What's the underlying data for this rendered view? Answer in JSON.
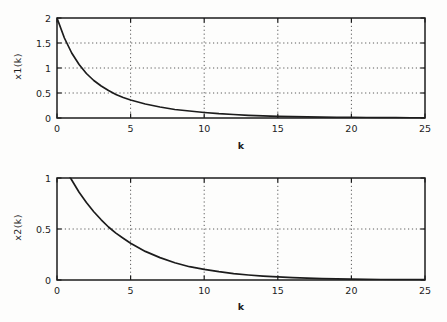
{
  "figure": {
    "background": "#fdfdfc",
    "axis_color": "#1c1c1c",
    "grid_color": "#5a5a5a",
    "line_color": "#1c1c1c"
  },
  "chart_data": [
    {
      "type": "line",
      "title": "",
      "xlabel": "k",
      "ylabel": "x1(k)",
      "xlim": [
        0,
        25
      ],
      "ylim": [
        0,
        2
      ],
      "xticks": [
        0,
        5,
        10,
        15,
        20,
        25
      ],
      "yticks": [
        0,
        0.5,
        1,
        1.5,
        2
      ],
      "grid": true,
      "legend": null,
      "axis_color": "#1c1c1c",
      "grid_color": "#5a5a5a",
      "line_color": "#1c1c1c",
      "points": [
        [
          0,
          2.0
        ],
        [
          0.5,
          1.6
        ],
        [
          1,
          1.3
        ],
        [
          1.5,
          1.07
        ],
        [
          2,
          0.89
        ],
        [
          2.5,
          0.75
        ],
        [
          3,
          0.64
        ],
        [
          3.5,
          0.55
        ],
        [
          4,
          0.47
        ],
        [
          4.5,
          0.41
        ],
        [
          5,
          0.36
        ],
        [
          6,
          0.28
        ],
        [
          7,
          0.22
        ],
        [
          8,
          0.17
        ],
        [
          9,
          0.14
        ],
        [
          10,
          0.11
        ],
        [
          11,
          0.086
        ],
        [
          12,
          0.069
        ],
        [
          13,
          0.055
        ],
        [
          14,
          0.044
        ],
        [
          15,
          0.035
        ],
        [
          16,
          0.028
        ],
        [
          17,
          0.023
        ],
        [
          18,
          0.018
        ],
        [
          19,
          0.014
        ],
        [
          20,
          0.012
        ],
        [
          21,
          0.009
        ],
        [
          22,
          0.007
        ],
        [
          23,
          0.006
        ],
        [
          24,
          0.005
        ],
        [
          25,
          0.004
        ]
      ]
    },
    {
      "type": "line",
      "title": "",
      "xlabel": "k",
      "ylabel": "x2(k)",
      "xlim": [
        0,
        25
      ],
      "ylim": [
        0,
        1
      ],
      "xticks": [
        0,
        5,
        10,
        15,
        20,
        25
      ],
      "yticks": [
        0,
        0.5,
        1
      ],
      "grid": true,
      "legend": null,
      "axis_color": "#1c1c1c",
      "grid_color": "#5a5a5a",
      "line_color": "#1c1c1c",
      "points": [
        [
          0,
          1.25
        ],
        [
          0.5,
          1.1
        ],
        [
          1,
          0.98
        ],
        [
          1.5,
          0.86
        ],
        [
          2,
          0.76
        ],
        [
          2.5,
          0.67
        ],
        [
          3,
          0.59
        ],
        [
          3.5,
          0.52
        ],
        [
          4,
          0.46
        ],
        [
          4.5,
          0.41
        ],
        [
          5,
          0.36
        ],
        [
          6,
          0.28
        ],
        [
          7,
          0.22
        ],
        [
          8,
          0.17
        ],
        [
          9,
          0.13
        ],
        [
          10,
          0.104
        ],
        [
          11,
          0.081
        ],
        [
          12,
          0.063
        ],
        [
          13,
          0.049
        ],
        [
          14,
          0.038
        ],
        [
          15,
          0.03
        ],
        [
          16,
          0.023
        ],
        [
          17,
          0.018
        ],
        [
          18,
          0.014
        ],
        [
          19,
          0.011
        ],
        [
          20,
          0.009
        ],
        [
          21,
          0.007
        ],
        [
          22,
          0.005
        ],
        [
          23,
          0.004
        ],
        [
          24,
          0.003
        ],
        [
          25,
          0.003
        ]
      ]
    }
  ]
}
